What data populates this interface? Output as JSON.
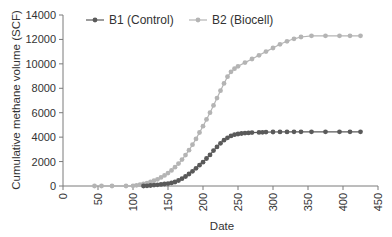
{
  "chart_data": {
    "type": "line",
    "title": "",
    "xlabel": "Date",
    "ylabel": "Cumulative methane volume (SCF)",
    "xlim": [
      0,
      450
    ],
    "ylim": [
      0,
      14000
    ],
    "x_ticks": [
      0,
      50,
      100,
      150,
      200,
      250,
      300,
      350,
      400,
      450
    ],
    "y_ticks": [
      0,
      2000,
      4000,
      6000,
      8000,
      10000,
      12000,
      14000
    ],
    "grid": false,
    "legend_position": "top-left inside",
    "series": [
      {
        "name": "B1 (Control)",
        "color": "#5a5a5a",
        "x": [
          115,
          120,
          125,
          130,
          135,
          140,
          145,
          150,
          155,
          160,
          165,
          170,
          175,
          180,
          185,
          190,
          195,
          200,
          205,
          210,
          215,
          220,
          225,
          230,
          235,
          240,
          245,
          250,
          255,
          260,
          265,
          270,
          280,
          285,
          290,
          300,
          310,
          320,
          330,
          340,
          355,
          375,
          395,
          410,
          425
        ],
        "y": [
          0,
          20,
          40,
          70,
          100,
          130,
          160,
          200,
          250,
          330,
          450,
          600,
          780,
          980,
          1200,
          1450,
          1700,
          1950,
          2250,
          2550,
          2900,
          3200,
          3500,
          3750,
          3950,
          4100,
          4200,
          4260,
          4300,
          4330,
          4350,
          4370,
          4390,
          4400,
          4410,
          4420,
          4430,
          4430,
          4440,
          4440,
          4440,
          4440,
          4440,
          4440,
          4440
        ]
      },
      {
        "name": "B2 (Biocell)",
        "color": "#b4b4b4",
        "x": [
          45,
          55,
          70,
          90,
          100,
          105,
          110,
          115,
          120,
          125,
          130,
          135,
          140,
          145,
          150,
          155,
          160,
          165,
          170,
          175,
          180,
          185,
          190,
          195,
          200,
          205,
          210,
          215,
          220,
          225,
          230,
          235,
          240,
          245,
          250,
          260,
          270,
          280,
          290,
          300,
          310,
          320,
          330,
          340,
          355,
          375,
          395,
          410,
          425
        ],
        "y": [
          0,
          0,
          0,
          0,
          20,
          60,
          110,
          170,
          240,
          330,
          430,
          550,
          700,
          870,
          1060,
          1280,
          1540,
          1830,
          2160,
          2530,
          2930,
          3380,
          3860,
          4380,
          4900,
          5450,
          6000,
          6600,
          7200,
          7800,
          8400,
          8950,
          9350,
          9600,
          9800,
          10100,
          10400,
          10700,
          11000,
          11300,
          11600,
          11850,
          12050,
          12200,
          12300,
          12300,
          12300,
          12300,
          12300
        ]
      }
    ]
  }
}
